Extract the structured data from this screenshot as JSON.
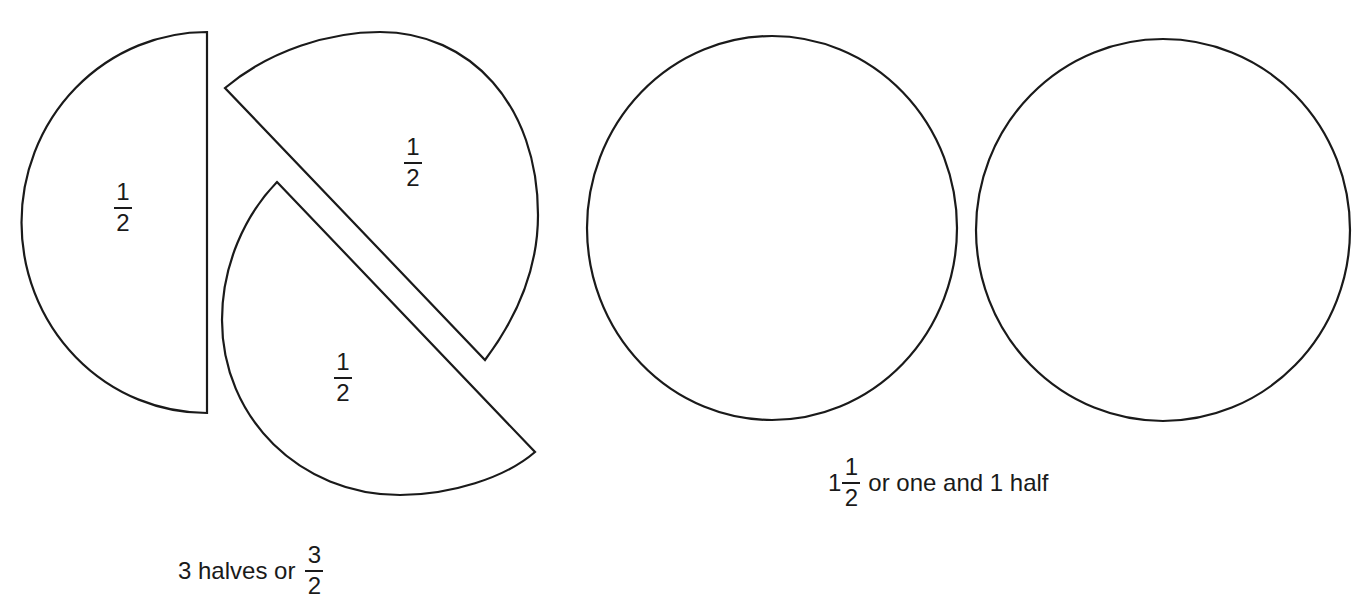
{
  "left_figure": {
    "pieces": [
      {
        "numerator": "1",
        "denominator": "2"
      },
      {
        "numerator": "1",
        "denominator": "2"
      },
      {
        "numerator": "1",
        "denominator": "2"
      }
    ],
    "caption": {
      "text": "3 halves or",
      "numerator": "3",
      "denominator": "2"
    }
  },
  "right_figure": {
    "circle_count": 2,
    "caption": {
      "whole": "1",
      "numerator": "1",
      "denominator": "2",
      "text": "or one and 1 half"
    }
  },
  "colors": {
    "stroke": "#1a1a1a",
    "background": "#ffffff"
  }
}
